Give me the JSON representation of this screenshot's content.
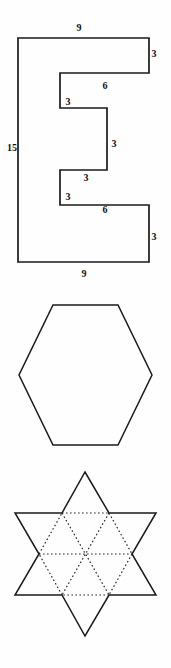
{
  "page": {
    "background_color": "#fefefe",
    "ink_color": "#1a1a1a"
  },
  "figures": [
    {
      "id": "e-shape",
      "name": "E-shaped polygon with dimension labels",
      "type": "polygon-outline",
      "stroke_color": "#1a1a1a",
      "labels": [
        {
          "text": "9",
          "name": "top-width-label",
          "x": 79,
          "y": 31
        },
        {
          "text": "3",
          "name": "top-right-height-label",
          "x": 154,
          "y": 57
        },
        {
          "text": "6",
          "name": "upper-inner-width-label",
          "x": 105,
          "y": 89
        },
        {
          "text": "3",
          "name": "upper-inner-height-label",
          "x": 68,
          "y": 105
        },
        {
          "text": "15",
          "name": "left-height-label",
          "x": 12,
          "y": 151
        },
        {
          "text": "3",
          "name": "middle-notch-height-label",
          "x": 114,
          "y": 147
        },
        {
          "text": "3",
          "name": "middle-notch-width-label",
          "x": 86,
          "y": 181
        },
        {
          "text": "3",
          "name": "lower-inner-height-label",
          "x": 68,
          "y": 200
        },
        {
          "text": "6",
          "name": "lower-inner-width-label",
          "x": 105,
          "y": 213
        },
        {
          "text": "3",
          "name": "bottom-right-height-label",
          "x": 154,
          "y": 240
        },
        {
          "text": "9",
          "name": "bottom-width-label",
          "x": 84,
          "y": 277
        }
      ],
      "outline_points": "18,38 149,38 149,73 60,73 60,108 107,108 107,170 60,170 60,205 149,205 149,262 18,262"
    },
    {
      "id": "hexagon",
      "name": "Regular hexagon",
      "type": "polygon-outline",
      "stroke_color": "#1a1a1a",
      "outline_points": "53,15 118,15 152,85 118,155 53,155 19,85"
    },
    {
      "id": "star",
      "name": "Six-pointed star with dotted interior triangles",
      "type": "hexagram",
      "stroke_color": "#1a1a1a",
      "dotted_color": "#2a2a2a",
      "outer_points": "85,12 109,53 156,53 132,94 156,135 109,135 85,176 62,135 15,135 39,94 15,53 62,53",
      "inner_hexagon": "62,53 109,53 132,94 109,135 62,135 39,94",
      "interior_dotted_segments": [
        "62,53 109,53",
        "109,53 132,94",
        "132,94 109,135",
        "109,135 62,135",
        "62,135 39,94",
        "39,94 62,53",
        "39,94 132,94",
        "62,53 109,135",
        "109,53 62,135"
      ]
    }
  ]
}
